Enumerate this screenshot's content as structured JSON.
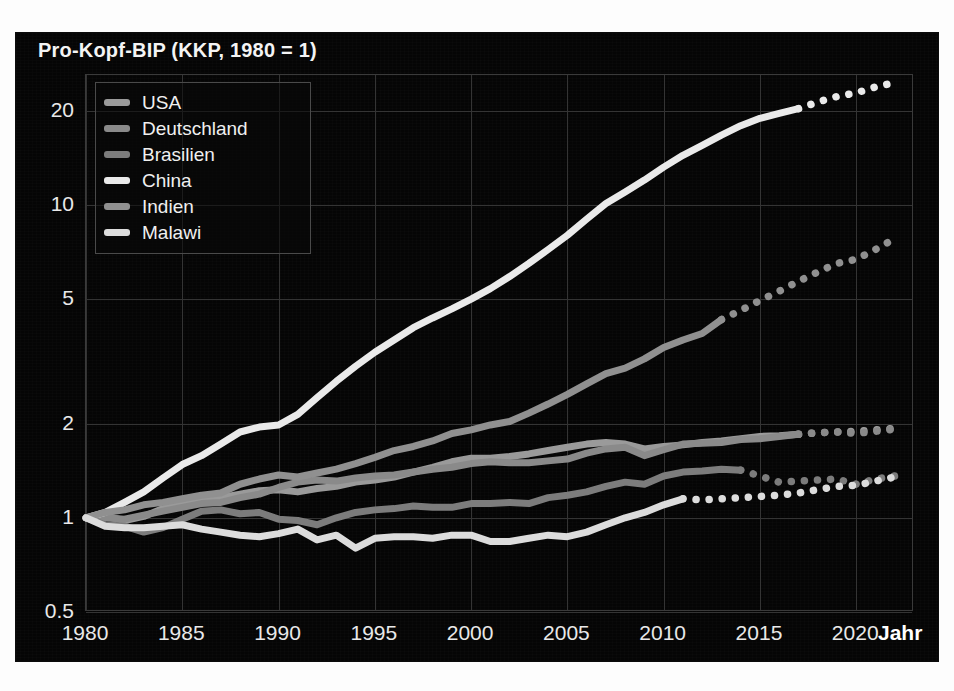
{
  "chart_data": {
    "type": "line",
    "title": "Pro-Kopf-BIP (KKP, 1980 = 1)",
    "xlabel": "Jahr",
    "ylabel": "",
    "yscale": "log",
    "ylim": [
      0.5,
      26
    ],
    "xlim": [
      1980,
      2023
    ],
    "grid": true,
    "legend_position": "top-left",
    "ytick_labels": [
      "0.5",
      "1",
      "2",
      "5",
      "10",
      "20"
    ],
    "ytick_values": [
      0.5,
      1,
      2,
      5,
      10,
      20
    ],
    "xtick_labels": [
      "1980",
      "1985",
      "1990",
      "1995",
      "2000",
      "2005",
      "2010",
      "2015",
      "2020"
    ],
    "xtick_values": [
      1980,
      1985,
      1990,
      1995,
      2000,
      2005,
      2010,
      2015,
      2020
    ],
    "note": "Solid segments are historical data; dotted segments are projections.",
    "series": [
      {
        "name": "USA",
        "color": "#9a9a9a",
        "solid_end_year": 2017,
        "x": [
          1980,
          1981,
          1982,
          1983,
          1984,
          1985,
          1986,
          1987,
          1988,
          1989,
          1990,
          1991,
          1992,
          1993,
          1994,
          1995,
          1996,
          1997,
          1998,
          1999,
          2000,
          2001,
          2002,
          2003,
          2004,
          2005,
          2006,
          2007,
          2008,
          2009,
          2010,
          2011,
          2012,
          2013,
          2014,
          2015,
          2016,
          2017,
          2018,
          2019,
          2020,
          2021,
          2022
        ],
        "y": [
          1.0,
          1.01,
          0.98,
          1.01,
          1.07,
          1.1,
          1.13,
          1.16,
          1.19,
          1.22,
          1.23,
          1.21,
          1.24,
          1.26,
          1.3,
          1.32,
          1.35,
          1.4,
          1.45,
          1.51,
          1.55,
          1.55,
          1.57,
          1.6,
          1.64,
          1.68,
          1.72,
          1.74,
          1.72,
          1.66,
          1.69,
          1.71,
          1.74,
          1.76,
          1.79,
          1.82,
          1.83,
          1.85,
          1.87,
          1.88,
          1.89,
          1.91,
          1.93
        ]
      },
      {
        "name": "Deutschland",
        "color": "#8a8a8a",
        "solid_end_year": 2017,
        "x": [
          1980,
          1981,
          1982,
          1983,
          1984,
          1985,
          1986,
          1987,
          1988,
          1989,
          1990,
          1991,
          1992,
          1993,
          1994,
          1995,
          1996,
          1997,
          1998,
          1999,
          2000,
          2001,
          2002,
          2003,
          2004,
          2005,
          2006,
          2007,
          2008,
          2009,
          2010,
          2011,
          2012,
          2013,
          2014,
          2015,
          2016,
          2017,
          2018,
          2019,
          2020,
          2021,
          2022
        ],
        "y": [
          1.0,
          1.0,
          0.99,
          1.02,
          1.05,
          1.08,
          1.11,
          1.12,
          1.16,
          1.19,
          1.25,
          1.3,
          1.32,
          1.31,
          1.34,
          1.36,
          1.37,
          1.4,
          1.43,
          1.45,
          1.49,
          1.51,
          1.5,
          1.5,
          1.52,
          1.54,
          1.61,
          1.66,
          1.68,
          1.58,
          1.65,
          1.72,
          1.73,
          1.74,
          1.78,
          1.79,
          1.82,
          1.85,
          1.87,
          1.88,
          1.86,
          1.89,
          1.92
        ]
      },
      {
        "name": "Brasilien",
        "color": "#7c7c7c",
        "solid_end_year": 2014,
        "x": [
          1980,
          1981,
          1982,
          1983,
          1984,
          1985,
          1986,
          1987,
          1988,
          1989,
          1990,
          1991,
          1992,
          1993,
          1994,
          1995,
          1996,
          1997,
          1998,
          1999,
          2000,
          2001,
          2002,
          2003,
          2004,
          2005,
          2006,
          2007,
          2008,
          2009,
          2010,
          2011,
          2012,
          2013,
          2014,
          2015,
          2016,
          2017,
          2018,
          2019,
          2020,
          2021,
          2022
        ],
        "y": [
          1.0,
          0.95,
          0.94,
          0.9,
          0.93,
          0.99,
          1.05,
          1.06,
          1.03,
          1.04,
          0.99,
          0.98,
          0.95,
          1.0,
          1.04,
          1.06,
          1.07,
          1.09,
          1.08,
          1.08,
          1.11,
          1.11,
          1.12,
          1.11,
          1.16,
          1.18,
          1.21,
          1.26,
          1.3,
          1.28,
          1.36,
          1.4,
          1.41,
          1.43,
          1.42,
          1.36,
          1.3,
          1.31,
          1.32,
          1.33,
          1.28,
          1.33,
          1.36
        ]
      },
      {
        "name": "China",
        "color": "#eaeaea",
        "solid_end_year": 2017,
        "x": [
          1980,
          1981,
          1982,
          1983,
          1984,
          1985,
          1986,
          1987,
          1988,
          1989,
          1990,
          1991,
          1992,
          1993,
          1994,
          1995,
          1996,
          1997,
          1998,
          1999,
          2000,
          2001,
          2002,
          2003,
          2004,
          2005,
          2006,
          2007,
          2008,
          2009,
          2010,
          2011,
          2012,
          2013,
          2014,
          2015,
          2016,
          2017,
          2018,
          2019,
          2020,
          2021,
          2022
        ],
        "y": [
          1.0,
          1.04,
          1.12,
          1.21,
          1.34,
          1.48,
          1.58,
          1.72,
          1.88,
          1.95,
          1.98,
          2.14,
          2.42,
          2.73,
          3.05,
          3.38,
          3.7,
          4.05,
          4.35,
          4.65,
          5.0,
          5.4,
          5.9,
          6.5,
          7.2,
          8.0,
          9.0,
          10.1,
          11.0,
          12.0,
          13.2,
          14.4,
          15.5,
          16.7,
          17.9,
          18.9,
          19.6,
          20.3,
          21.3,
          22.2,
          22.8,
          23.8,
          24.6
        ]
      },
      {
        "name": "Indien",
        "color": "#909090",
        "solid_end_year": 2013,
        "x": [
          1980,
          1981,
          1982,
          1983,
          1984,
          1985,
          1986,
          1987,
          1988,
          1989,
          1990,
          1991,
          1992,
          1993,
          1994,
          1995,
          1996,
          1997,
          1998,
          1999,
          2000,
          2001,
          2002,
          2003,
          2004,
          2005,
          2006,
          2007,
          2008,
          2009,
          2010,
          2011,
          2012,
          2013,
          2014,
          2015,
          2016,
          2017,
          2018,
          2019,
          2020,
          2021,
          2022
        ],
        "y": [
          1.0,
          1.04,
          1.06,
          1.1,
          1.12,
          1.15,
          1.18,
          1.2,
          1.28,
          1.33,
          1.37,
          1.35,
          1.39,
          1.43,
          1.49,
          1.56,
          1.64,
          1.69,
          1.76,
          1.86,
          1.91,
          1.98,
          2.03,
          2.16,
          2.31,
          2.48,
          2.68,
          2.89,
          3.01,
          3.22,
          3.5,
          3.7,
          3.88,
          4.3,
          4.6,
          4.95,
          5.3,
          5.7,
          6.1,
          6.5,
          6.7,
          7.2,
          7.8
        ]
      },
      {
        "name": "Malawi",
        "color": "#dcdcdc",
        "solid_end_year": 2011,
        "x": [
          1980,
          1981,
          1982,
          1983,
          1984,
          1985,
          1986,
          1987,
          1988,
          1989,
          1990,
          1991,
          1992,
          1993,
          1994,
          1995,
          1996,
          1997,
          1998,
          1999,
          2000,
          2001,
          2002,
          2003,
          2004,
          2005,
          2006,
          2007,
          2008,
          2009,
          2010,
          2011,
          2012,
          2013,
          2014,
          2015,
          2016,
          2017,
          2018,
          2019,
          2020,
          2021,
          2022
        ],
        "y": [
          1.0,
          0.94,
          0.93,
          0.93,
          0.94,
          0.95,
          0.92,
          0.9,
          0.88,
          0.87,
          0.89,
          0.92,
          0.85,
          0.88,
          0.8,
          0.86,
          0.87,
          0.87,
          0.86,
          0.88,
          0.88,
          0.84,
          0.84,
          0.86,
          0.88,
          0.87,
          0.9,
          0.95,
          1.0,
          1.04,
          1.1,
          1.15,
          1.14,
          1.15,
          1.16,
          1.17,
          1.18,
          1.2,
          1.23,
          1.26,
          1.27,
          1.31,
          1.35
        ]
      }
    ]
  },
  "legend": {
    "items": [
      {
        "label": "USA"
      },
      {
        "label": "Deutschland"
      },
      {
        "label": "Brasilien"
      },
      {
        "label": "China"
      },
      {
        "label": "Indien"
      },
      {
        "label": "Malawi"
      }
    ]
  },
  "colors": {
    "panel_background": "#050505",
    "grid": "#343434",
    "axis_text": "#e9e9e9",
    "title_text": "#f4f4f4"
  }
}
